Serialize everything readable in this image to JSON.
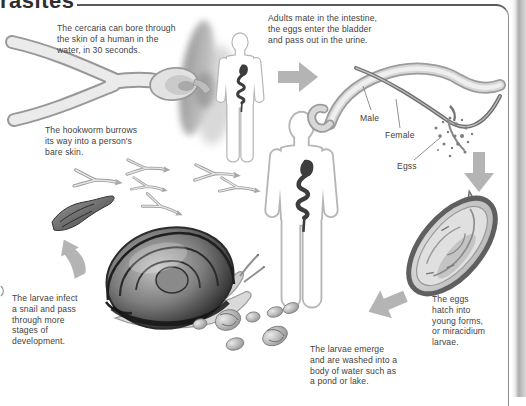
{
  "page": {
    "title_partial": "rasites"
  },
  "colors": {
    "arrow": "#b4b4b4",
    "annotation_text": "#424242",
    "title_rule": "#5a5a5a",
    "panel_border": "#8c8c8c",
    "gut": "#3d3d3d"
  },
  "annotations": {
    "cercaria": "The cercaria can bore through\nthe skin of a human in the\nwater, in 30 seconds.",
    "adults": "Adults mate in the intestine,\nthe eggs enter the bladder\nand pass out in the urine.",
    "hookworm": "The hookworm burrows\nits way into a person's\nbare skin.",
    "eggs_hatch": "The eggs\nhatch into\nyoung forms,\nor miracidium\nlarvae.",
    "larvae_emerge": "The larvae emerge\nand are washed into a\nbody of water such as\na pond or lake.",
    "larvae_infect": "The larvae infect\na snail and pass\nthrough more\nstages of\ndevelopment."
  },
  "labels": {
    "male": "Male",
    "female": "Female",
    "eggs": "Egss"
  }
}
